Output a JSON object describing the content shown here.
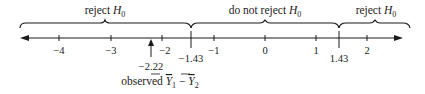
{
  "diagram": {
    "type": "number-line",
    "axis": {
      "min": -4.8,
      "max": 2.6,
      "ticks": [
        {
          "value": -4,
          "label": "−4"
        },
        {
          "value": -3,
          "label": "−3"
        },
        {
          "value": -2,
          "label": "−2"
        },
        {
          "value": -1,
          "label": "−1"
        },
        {
          "value": 0,
          "label": "0"
        },
        {
          "value": 1,
          "label": "1"
        },
        {
          "value": 2,
          "label": "2"
        }
      ],
      "arrows": "both"
    },
    "critical_values": [
      {
        "value": -1.43,
        "label": "−1.43"
      },
      {
        "value": 1.43,
        "label": "1.43"
      }
    ],
    "regions": [
      {
        "name": "left-reject",
        "label_text": "reject ",
        "label_symbol": "H",
        "label_sub": "0",
        "from": -4.8,
        "to": -1.43
      },
      {
        "name": "do-not-reject",
        "label_text": "do not reject ",
        "label_symbol": "H",
        "label_sub": "0",
        "from": -1.43,
        "to": 1.43
      },
      {
        "name": "right-reject",
        "label_text": "reject ",
        "label_symbol": "H",
        "label_sub": "0",
        "from": 1.43,
        "to": 2.6
      }
    ],
    "observed": {
      "value": -2.22,
      "value_label": "−2.22",
      "caption_prefix": "observed ",
      "caption_var1": "Y",
      "caption_sub1": "1",
      "caption_minus": " − ",
      "caption_var2": "Y",
      "caption_sub2": "2"
    },
    "colors": {
      "line": "#1a1a1a",
      "text": "#1a1a1a",
      "background": "#ffffff"
    }
  }
}
